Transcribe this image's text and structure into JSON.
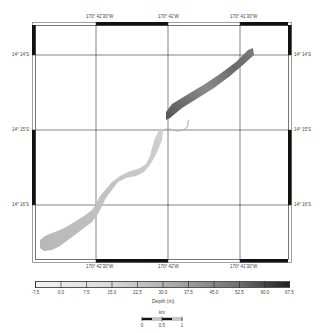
{
  "map": {
    "graticule": {
      "longitude_labels": [
        "170° 42'30\"W",
        "170° 42'W",
        "170° 41'30\"W"
      ],
      "latitude_labels": [
        "14° 14'S",
        "14° 15'S",
        "14° 16'S"
      ]
    },
    "features": {
      "northeast_swath": "dark grey bathymetry swath (deeper)",
      "southwest_channel": "light grey winding channel (shallower)"
    }
  },
  "colorbar": {
    "title": "Depth (m)",
    "ticks": [
      "-7.5",
      "0.0",
      "7.5",
      "15.0",
      "22.5",
      "30.0",
      "37.5",
      "45.0",
      "52.5",
      "60.0",
      "67.5"
    ],
    "min": -7.5,
    "max": 67.5,
    "color_low": "#f2f2f2",
    "color_high": "#1a1a1a"
  },
  "scalebar": {
    "unit": "km",
    "labels": [
      "0",
      "0.5",
      "1"
    ]
  }
}
